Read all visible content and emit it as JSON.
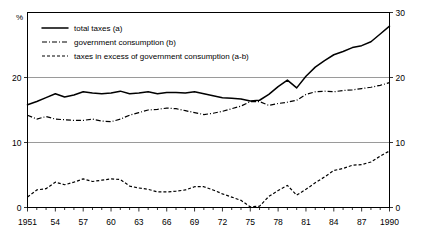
{
  "chart_data": {
    "type": "line",
    "title": "",
    "xlabel": "",
    "ylabel": "%",
    "unit_label": "%",
    "grid": true,
    "legend_position": "top-left",
    "xlim": [
      1951,
      1990
    ],
    "ylim": [
      0,
      30
    ],
    "y_left_ticks": [
      "0",
      "10",
      "20"
    ],
    "y_right_ticks": [
      "0",
      "10",
      "20",
      "30"
    ],
    "y_left_tick_values": [
      0,
      10,
      20
    ],
    "y_right_tick_values": [
      0,
      10,
      20,
      30
    ],
    "x_tick_labels": [
      "1951",
      "54",
      "57",
      "60",
      "63",
      "66",
      "69",
      "72",
      "75",
      "78",
      "81",
      "84",
      "87",
      "1990"
    ],
    "x_tick_values": [
      1951,
      1954,
      1957,
      1960,
      1963,
      1966,
      1969,
      1972,
      1975,
      1978,
      1981,
      1984,
      1987,
      1990
    ],
    "x": [
      1951,
      1952,
      1953,
      1954,
      1955,
      1956,
      1957,
      1958,
      1959,
      1960,
      1961,
      1962,
      1963,
      1964,
      1965,
      1966,
      1967,
      1968,
      1969,
      1970,
      1971,
      1972,
      1973,
      1974,
      1975,
      1976,
      1977,
      1978,
      1979,
      1980,
      1981,
      1982,
      1983,
      1984,
      1985,
      1986,
      1987,
      1988,
      1989,
      1990
    ],
    "series": [
      {
        "name": "total taxes (a)",
        "key": "total_taxes",
        "style": "solid",
        "color": "#000000",
        "values": [
          15.8,
          16.3,
          16.9,
          17.5,
          17.0,
          17.3,
          17.8,
          17.6,
          17.5,
          17.6,
          17.9,
          17.5,
          17.6,
          17.8,
          17.5,
          17.7,
          17.7,
          17.6,
          17.8,
          17.5,
          17.2,
          16.9,
          16.8,
          16.7,
          16.4,
          16.5,
          17.4,
          18.6,
          19.6,
          18.4,
          20.2,
          21.6,
          22.6,
          23.5,
          24.0,
          24.6,
          24.9,
          25.5,
          26.7,
          27.9
        ]
      },
      {
        "name": "government consumption (b)",
        "key": "government_consumption",
        "style": "dash-dot",
        "color": "#000000",
        "values": [
          14.2,
          13.6,
          14.0,
          13.6,
          13.5,
          13.4,
          13.4,
          13.6,
          13.3,
          13.2,
          13.6,
          14.2,
          14.6,
          15.0,
          15.1,
          15.3,
          15.2,
          14.9,
          14.6,
          14.3,
          14.5,
          14.8,
          15.2,
          15.6,
          16.3,
          16.3,
          15.7,
          16.0,
          16.2,
          16.5,
          17.4,
          17.8,
          17.9,
          17.8,
          18.0,
          18.1,
          18.3,
          18.5,
          18.8,
          19.2
        ]
      },
      {
        "name": "taxes in excess of government consumption (a-b)",
        "key": "taxes_in_excess",
        "style": "dashed",
        "color": "#000000",
        "values": [
          1.6,
          2.7,
          2.9,
          3.9,
          3.5,
          3.9,
          4.4,
          4.0,
          4.2,
          4.4,
          4.3,
          3.3,
          3.0,
          2.8,
          2.4,
          2.4,
          2.5,
          2.7,
          3.2,
          3.2,
          2.7,
          2.1,
          1.6,
          1.1,
          0.1,
          0.2,
          1.7,
          2.6,
          3.4,
          1.9,
          2.8,
          3.8,
          4.7,
          5.7,
          6.0,
          6.5,
          6.6,
          7.0,
          7.9,
          8.7
        ]
      }
    ]
  },
  "legend": {
    "entries": [
      {
        "label": "total taxes (a)",
        "style": "solid"
      },
      {
        "label": "government consumption (b)",
        "style": "dash-dot"
      },
      {
        "label": "taxes in excess of government consumption (a-b)",
        "style": "dashed"
      }
    ]
  }
}
